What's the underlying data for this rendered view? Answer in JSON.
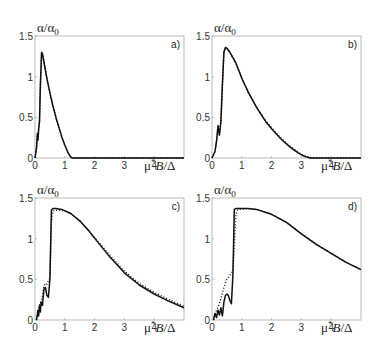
{
  "figure": {
    "layout": "2x2 grid",
    "panels_order": [
      "a)",
      "b)",
      "c)",
      "d)"
    ]
  },
  "chart_data": [
    {
      "type": "line",
      "panel": "a)",
      "ylabel": "α/α0",
      "xlabel": "μ*B/Δ",
      "xlim": [
        0,
        5
      ],
      "ylim": [
        0,
        1.5
      ],
      "xticks": [
        "0",
        "1",
        "2",
        "3",
        "4"
      ],
      "yticks": [
        "0",
        "0.5",
        "1",
        "1.5"
      ],
      "grid": false,
      "series": [
        {
          "name": "solid",
          "style": "solid",
          "x": [
            0,
            0.05,
            0.08,
            0.1,
            0.12,
            0.15,
            0.18,
            0.22,
            0.25,
            0.3,
            0.4,
            0.5,
            0.6,
            0.7,
            0.8,
            0.9,
            1.0,
            1.1,
            1.2,
            1.25,
            5.0
          ],
          "y": [
            0,
            0.12,
            0.3,
            0.22,
            0.35,
            0.45,
            0.9,
            1.3,
            1.28,
            1.18,
            0.98,
            0.8,
            0.64,
            0.5,
            0.38,
            0.26,
            0.16,
            0.07,
            0.01,
            0,
            0
          ]
        },
        {
          "name": "dotted",
          "style": "dotted",
          "x": [
            0,
            0.05,
            0.08,
            0.1,
            0.12,
            0.15,
            0.18,
            0.22,
            0.25,
            0.3,
            0.4,
            0.5,
            0.6,
            0.7,
            0.8,
            0.9,
            1.0,
            1.1,
            1.2,
            1.25,
            5.0
          ],
          "y": [
            0,
            0.12,
            0.28,
            0.25,
            0.35,
            0.45,
            0.9,
            1.29,
            1.28,
            1.18,
            0.98,
            0.8,
            0.64,
            0.5,
            0.38,
            0.26,
            0.16,
            0.07,
            0.01,
            0,
            0
          ]
        }
      ]
    },
    {
      "type": "line",
      "panel": "b)",
      "ylabel": "α/α0",
      "xlabel": "μ*B/Δ",
      "xlim": [
        0,
        5
      ],
      "ylim": [
        0,
        1.5
      ],
      "xticks": [
        "0",
        "1",
        "2",
        "3",
        "4"
      ],
      "yticks": [
        "0",
        "0.5",
        "1",
        "1.5"
      ],
      "grid": false,
      "series": [
        {
          "name": "solid",
          "style": "solid",
          "x": [
            0,
            0.1,
            0.15,
            0.2,
            0.25,
            0.3,
            0.35,
            0.4,
            0.45,
            0.5,
            0.6,
            0.8,
            1.0,
            1.2,
            1.5,
            1.8,
            2.0,
            2.3,
            2.6,
            2.9,
            3.1,
            3.3,
            5.0
          ],
          "y": [
            0,
            0.08,
            0.2,
            0.4,
            0.28,
            0.45,
            0.9,
            1.3,
            1.36,
            1.35,
            1.3,
            1.17,
            0.98,
            0.82,
            0.62,
            0.45,
            0.36,
            0.24,
            0.14,
            0.06,
            0.02,
            0,
            0
          ]
        },
        {
          "name": "dotted",
          "style": "dotted",
          "x": [
            0,
            0.1,
            0.15,
            0.2,
            0.25,
            0.3,
            0.35,
            0.4,
            0.45,
            0.5,
            0.6,
            0.8,
            1.0,
            1.2,
            1.5,
            1.8,
            2.0,
            2.3,
            2.6,
            2.9,
            3.1,
            3.35,
            5.0
          ],
          "y": [
            0,
            0.08,
            0.2,
            0.38,
            0.3,
            0.45,
            0.9,
            1.3,
            1.35,
            1.35,
            1.3,
            1.17,
            0.98,
            0.82,
            0.62,
            0.46,
            0.37,
            0.25,
            0.15,
            0.07,
            0.03,
            0,
            0
          ]
        }
      ]
    },
    {
      "type": "line",
      "panel": "c)",
      "ylabel": "α/α0",
      "xlabel": "μ*B/Δ",
      "xlim": [
        0,
        5
      ],
      "ylim": [
        0,
        1.5
      ],
      "xticks": [
        "0",
        "1",
        "2",
        "3",
        "4"
      ],
      "yticks": [
        "0",
        "0.5",
        "1",
        "1.5"
      ],
      "grid": false,
      "series": [
        {
          "name": "solid",
          "style": "solid",
          "x": [
            0.05,
            0.1,
            0.12,
            0.15,
            0.18,
            0.2,
            0.25,
            0.3,
            0.35,
            0.4,
            0.45,
            0.5,
            0.55,
            0.6,
            0.7,
            0.9,
            1.2,
            1.5,
            1.8,
            2.1,
            2.5,
            3.0,
            3.5,
            4.0,
            4.5,
            5.0
          ],
          "y": [
            0,
            0.12,
            0.05,
            0.18,
            0.1,
            0.22,
            0.18,
            0.38,
            0.4,
            0.3,
            0.28,
            0.5,
            1.35,
            1.37,
            1.37,
            1.36,
            1.31,
            1.22,
            1.1,
            0.96,
            0.78,
            0.58,
            0.43,
            0.32,
            0.23,
            0.15
          ]
        },
        {
          "name": "dotted",
          "style": "dotted",
          "x": [
            0.05,
            0.1,
            0.15,
            0.2,
            0.25,
            0.3,
            0.35,
            0.4,
            0.45,
            0.5,
            0.55,
            0.6,
            0.7,
            0.9,
            1.2,
            1.5,
            1.8,
            2.1,
            2.5,
            3.0,
            3.5,
            4.0,
            4.5,
            5.0
          ],
          "y": [
            0,
            0.1,
            0.18,
            0.22,
            0.3,
            0.42,
            0.45,
            0.44,
            0.48,
            0.52,
            1.2,
            1.34,
            1.35,
            1.35,
            1.31,
            1.22,
            1.1,
            0.97,
            0.8,
            0.6,
            0.45,
            0.34,
            0.25,
            0.17
          ]
        }
      ]
    },
    {
      "type": "line",
      "panel": "d)",
      "ylabel": "α/α0",
      "xlabel": "μ*B/Δ",
      "xlim": [
        0,
        5
      ],
      "ylim": [
        0,
        1.5
      ],
      "xticks": [
        "0",
        "1",
        "2",
        "3",
        "4"
      ],
      "yticks": [
        "0",
        "0.5",
        "1",
        "1.5"
      ],
      "grid": false,
      "series": [
        {
          "name": "solid",
          "style": "solid",
          "x": [
            0.05,
            0.1,
            0.15,
            0.2,
            0.25,
            0.3,
            0.35,
            0.4,
            0.45,
            0.5,
            0.55,
            0.6,
            0.65,
            0.7,
            0.75,
            0.8,
            0.9,
            1.2,
            1.5,
            2.0,
            2.5,
            3.0,
            3.5,
            4.0,
            4.5,
            5.0
          ],
          "y": [
            0,
            0.08,
            0.03,
            0.12,
            0.06,
            0.15,
            0.05,
            0.22,
            0.3,
            0.32,
            0.3,
            0.24,
            0.2,
            0.55,
            1.36,
            1.37,
            1.37,
            1.37,
            1.36,
            1.3,
            1.2,
            1.06,
            0.93,
            0.82,
            0.71,
            0.62
          ]
        },
        {
          "name": "dotted",
          "style": "dotted",
          "x": [
            0.05,
            0.1,
            0.2,
            0.3,
            0.4,
            0.5,
            0.6,
            0.7,
            0.75,
            0.8,
            0.85,
            0.9,
            1.2,
            1.5,
            2.0,
            2.5,
            3.0,
            3.5,
            4.0,
            4.5,
            5.0
          ],
          "y": [
            0,
            0.08,
            0.16,
            0.26,
            0.4,
            0.5,
            0.55,
            0.6,
            0.9,
            1.3,
            1.35,
            1.36,
            1.37,
            1.36,
            1.3,
            1.2,
            1.06,
            0.93,
            0.82,
            0.71,
            0.62
          ]
        }
      ]
    }
  ]
}
